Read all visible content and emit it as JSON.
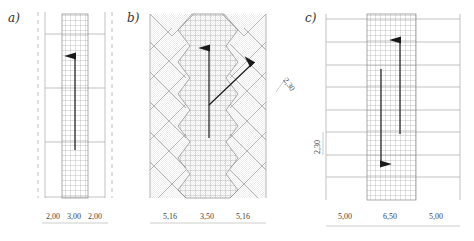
{
  "panels": [
    {
      "label": "a)",
      "dimensions": [
        "2,00",
        "3,00",
        "2,00"
      ],
      "arrows": [
        "up"
      ]
    },
    {
      "label": "b)",
      "dimensions": [
        "5,16",
        "3,50",
        "5,16"
      ],
      "side_dimension": "2,30",
      "arrows": [
        "up",
        "diagonal-up-right"
      ]
    },
    {
      "label": "c)",
      "dimensions": [
        "5,00",
        "6,50",
        "5,00"
      ],
      "side_dimension": "2,30",
      "arrows": [
        "down",
        "up"
      ]
    }
  ],
  "colors": {
    "line": "#888888",
    "grid": "#999999",
    "arrow": "#1a1a1a"
  }
}
